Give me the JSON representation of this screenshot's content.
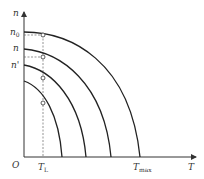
{
  "diagram": {
    "title": "",
    "axes": {
      "y_label": "n",
      "x_label": "T",
      "origin_label": "O"
    },
    "y_ticks": [
      {
        "id": "n0",
        "main": "n",
        "sub": "0"
      },
      {
        "id": "n",
        "main": "n",
        "sub": ""
      },
      {
        "id": "nprime",
        "main": "n'",
        "sub": ""
      }
    ],
    "x_ticks": [
      {
        "id": "TL",
        "main": "T",
        "sub": "L"
      },
      {
        "id": "Tmax",
        "main": "T",
        "sub": "max"
      }
    ],
    "curves": [
      {
        "name": "curve-1",
        "n_intercept_px": 32,
        "t_intercept_px": 140
      },
      {
        "name": "curve-2",
        "n_intercept_px": 49,
        "t_intercept_px": 111
      },
      {
        "name": "curve-3",
        "n_intercept_px": 65,
        "t_intercept_px": 86
      },
      {
        "name": "curve-4",
        "n_intercept_px": 81,
        "t_intercept_px": 62
      }
    ],
    "colors": {
      "axis": "#333333",
      "curve": "#222222",
      "dashed": "#555555"
    }
  }
}
